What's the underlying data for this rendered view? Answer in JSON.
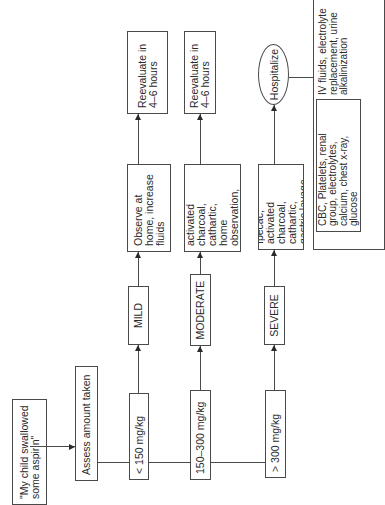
{
  "diagram": {
    "start": {
      "label": "\"My child swallowed\nsome aspirin\""
    },
    "assess": {
      "label": "Assess amount taken"
    },
    "doses": [
      {
        "label": "< 150 mg/kg"
      },
      {
        "label": "150–300 mg/kg"
      },
      {
        "label": "> 300 mg/kg"
      }
    ],
    "severity": [
      {
        "label": "MILD"
      },
      {
        "label": "MODERATE"
      },
      {
        "label": "SEVERE"
      }
    ],
    "treatments": [
      {
        "label": "Observe at\nhome, increase\nfluids"
      },
      {
        "label": "Ipecac, activated\ncharcoal, cathartic,\nhome observation,\nincreased fluids"
      },
      {
        "label": "Ipecac, activated\ncharcoal, cathartic,\ngastric lavage"
      }
    ],
    "followups": [
      {
        "label": "Reevaluate in\n4–6 hours"
      },
      {
        "label": "Reevaluate in\n4–6 hours"
      }
    ],
    "hospitalize": {
      "label": "Hospitalize"
    },
    "hospital_actions": {
      "labs": "CBC, Platelets, renal\ngroup, electrolytes,\ncalcium, chest x-ray,\nglucose",
      "therapy": "IV fluids, electrolyte\nreplacement, urine\nalkalinization"
    }
  }
}
